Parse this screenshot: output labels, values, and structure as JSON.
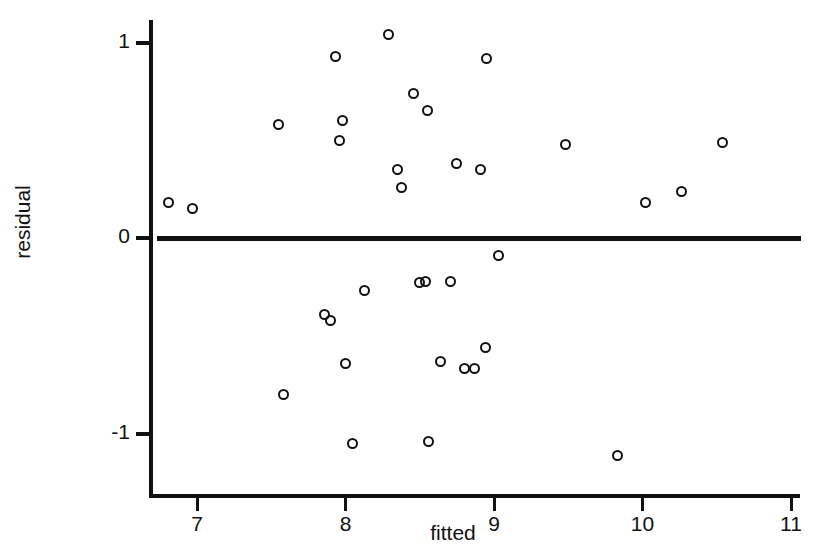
{
  "chart_data": {
    "type": "scatter",
    "title": "",
    "xlabel": "fitted",
    "ylabel": "residual",
    "xlim": [
      6.65,
      11.05
    ],
    "ylim": [
      -1.32,
      1.22
    ],
    "xticks": [
      7,
      8,
      9,
      10,
      11
    ],
    "yticks": [
      1,
      0,
      -1
    ],
    "xtick_labels": [
      "7",
      "8",
      "9",
      "10",
      "11"
    ],
    "ytick_labels": [
      "1",
      "0",
      "-1"
    ],
    "grid": false,
    "legend": null,
    "annotations": [],
    "reference_lines": [
      {
        "orientation": "horizontal",
        "value": 0,
        "label": "",
        "color": "#111111"
      }
    ],
    "marker": {
      "shape": "open-circle",
      "color": "#111111",
      "size": 11
    },
    "points": [
      {
        "x": 6.81,
        "y": 0.18
      },
      {
        "x": 6.97,
        "y": 0.15
      },
      {
        "x": 7.55,
        "y": 0.58
      },
      {
        "x": 7.58,
        "y": -0.8
      },
      {
        "x": 7.86,
        "y": -0.39
      },
      {
        "x": 7.9,
        "y": -0.42
      },
      {
        "x": 7.93,
        "y": 0.93
      },
      {
        "x": 7.96,
        "y": 0.5
      },
      {
        "x": 7.98,
        "y": 0.6
      },
      {
        "x": 8.0,
        "y": -0.64
      },
      {
        "x": 8.05,
        "y": -1.05
      },
      {
        "x": 8.13,
        "y": -0.27
      },
      {
        "x": 8.29,
        "y": 1.04
      },
      {
        "x": 8.35,
        "y": 0.35
      },
      {
        "x": 8.38,
        "y": 0.26
      },
      {
        "x": 8.46,
        "y": 0.74
      },
      {
        "x": 8.5,
        "y": -0.23
      },
      {
        "x": 8.54,
        "y": -0.22
      },
      {
        "x": 8.55,
        "y": 0.65
      },
      {
        "x": 8.56,
        "y": -1.04
      },
      {
        "x": 8.64,
        "y": -0.63
      },
      {
        "x": 8.71,
        "y": -0.22
      },
      {
        "x": 8.75,
        "y": 0.38
      },
      {
        "x": 8.8,
        "y": -0.67
      },
      {
        "x": 8.87,
        "y": -0.67
      },
      {
        "x": 8.91,
        "y": 0.35
      },
      {
        "x": 8.95,
        "y": 0.92
      },
      {
        "x": 8.94,
        "y": -0.56
      },
      {
        "x": 9.03,
        "y": -0.09
      },
      {
        "x": 9.48,
        "y": 0.48
      },
      {
        "x": 9.83,
        "y": -1.11
      },
      {
        "x": 10.02,
        "y": 0.18
      },
      {
        "x": 10.26,
        "y": 0.24
      },
      {
        "x": 10.54,
        "y": 0.49
      }
    ]
  }
}
